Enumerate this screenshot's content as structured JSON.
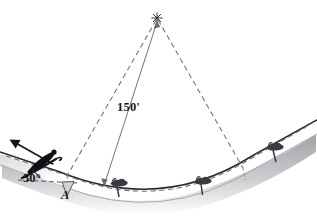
{
  "figure": {
    "background_color": "#ffffff",
    "width": 317,
    "height": 220
  },
  "labels": {
    "radius": "150'",
    "angle": "30°",
    "point_a": "A"
  },
  "colors": {
    "ink": "#17171a",
    "dashed_line": "#6e6e74",
    "dimension_line": "#6a6a70",
    "terrain_outline": "#2a2a2e",
    "terrain_fill": "#ffffff",
    "terrain_shadow": "#b9b9bd",
    "skier": "#101014",
    "tree": "#3a3a40"
  },
  "geometry": {
    "center_of_curvature": {
      "x": 157,
      "y": 18,
      "marker": "star"
    },
    "radius_dimension": {
      "from": {
        "x": 157,
        "y": 20
      },
      "to": {
        "x": 104,
        "y": 186
      },
      "style": "double-headed-arrow",
      "value": "150'"
    },
    "dashed_leg_left": {
      "from": {
        "x": 157,
        "y": 19
      },
      "to": {
        "x": 67,
        "y": 176
      }
    },
    "dashed_leg_right": {
      "from": {
        "x": 157,
        "y": 19
      },
      "to": {
        "x": 243,
        "y": 168
      }
    },
    "slope_angle_deg": 30,
    "arc_path_dashed": "M 8,158 L 67,176 Q 160,214 250,160 L 305,137"
  },
  "elements": {
    "skier": {
      "name": "skier",
      "position": {
        "x": 44,
        "y": 157
      },
      "heading_deg": -30
    },
    "velocity_arrow": {
      "from": {
        "x": 52,
        "y": 163
      },
      "to": {
        "x": 10,
        "y": 140
      }
    },
    "angle_arc_baseline": {
      "from": {
        "x": 20,
        "y": 178
      },
      "to": {
        "x": 76,
        "y": 181
      }
    },
    "trees": [
      {
        "name": "tree-1",
        "x": 116,
        "y": 188
      },
      {
        "name": "tree-2",
        "x": 200,
        "y": 186
      },
      {
        "name": "tree-3",
        "x": 272,
        "y": 152
      }
    ]
  }
}
